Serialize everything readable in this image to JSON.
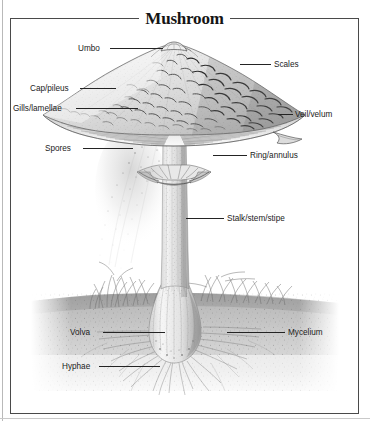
{
  "figure": {
    "title": "Mushroom",
    "kind": "anatomical-diagram",
    "frame_color": "#4a4a4a",
    "background_color": "#ffffff",
    "ink_color": "#1b1b1b"
  },
  "labels": [
    {
      "id": "umbo",
      "text": "Umbo",
      "side": "left"
    },
    {
      "id": "scales",
      "text": "Scales",
      "side": "right"
    },
    {
      "id": "cap",
      "text": "Cap/pileus",
      "side": "left"
    },
    {
      "id": "gills",
      "text": "Gills/lamellae",
      "side": "left"
    },
    {
      "id": "veil",
      "text": "Veil/velum",
      "side": "right"
    },
    {
      "id": "spores",
      "text": "Spores",
      "side": "left"
    },
    {
      "id": "ring",
      "text": "Ring/annulus",
      "side": "right"
    },
    {
      "id": "stalk",
      "text": "Stalk/stem/stipe",
      "side": "right"
    },
    {
      "id": "volva",
      "text": "Volva",
      "side": "left"
    },
    {
      "id": "mycelium",
      "text": "Mycelium",
      "side": "right"
    },
    {
      "id": "hyphae",
      "text": "Hyphae",
      "side": "left"
    }
  ]
}
